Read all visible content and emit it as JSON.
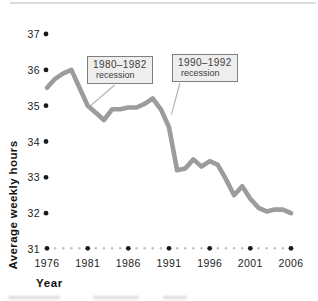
{
  "chart_data": {
    "type": "line",
    "title": "",
    "xlabel": "Year",
    "ylabel": "Average weekly hours",
    "x": [
      1976,
      1977,
      1978,
      1979,
      1980,
      1981,
      1982,
      1983,
      1984,
      1985,
      1986,
      1987,
      1988,
      1989,
      1990,
      1991,
      1992,
      1993,
      1994,
      1995,
      1996,
      1997,
      1998,
      1999,
      2000,
      2001,
      2002,
      2003,
      2004,
      2005,
      2006
    ],
    "series": [
      {
        "name": "Average weekly hours",
        "values": [
          35.5,
          35.75,
          35.9,
          36.0,
          35.5,
          35.0,
          34.8,
          34.6,
          34.9,
          34.9,
          34.95,
          34.95,
          35.05,
          35.2,
          34.9,
          34.4,
          33.2,
          33.25,
          33.5,
          33.3,
          33.45,
          33.35,
          32.95,
          32.5,
          32.75,
          32.4,
          32.15,
          32.05,
          32.1,
          32.1,
          32.0
        ]
      }
    ],
    "xticks": [
      1976,
      1981,
      1986,
      1991,
      1996,
      2001,
      2006
    ],
    "yticks": [
      31,
      32,
      33,
      34,
      35,
      36,
      37
    ],
    "xlim": [
      1976,
      2006
    ],
    "ylim": [
      31,
      37
    ],
    "grid": false,
    "legend": "none",
    "line_color": "#9c9c9c",
    "tick_dot_color": "#1b1b1b",
    "minor_dot_color": "#bdbdbd",
    "leader_color": "#b5b5b5",
    "annotations": [
      {
        "line1": "1980–1982",
        "line2": "recession",
        "target_year": 1981.1,
        "target_value": 34.95,
        "start_frac": 0.42
      },
      {
        "line1": "1990–1992",
        "line2": "recession",
        "target_year": 1991.3,
        "target_value": 34.75,
        "start_frac": 0.12
      }
    ]
  }
}
